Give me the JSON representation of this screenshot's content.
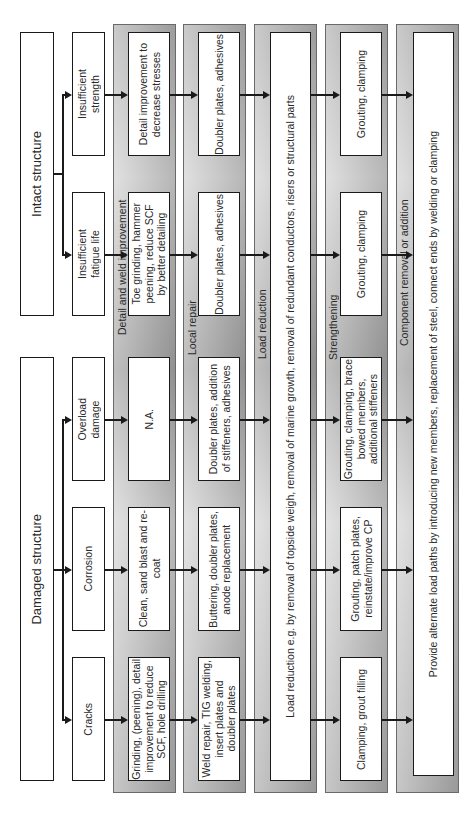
{
  "top": {
    "intact": "Intact structure",
    "damaged": "Damaged structure"
  },
  "causes": [
    {
      "id": "insufficient-strength",
      "label": "Insufficient\nstrength"
    },
    {
      "id": "insufficient-fatigue-life",
      "label": "Insufficient\nfatigue life"
    },
    {
      "id": "overload-damage",
      "label": "Overload\ndamage"
    },
    {
      "id": "corrosion",
      "label": "Corrosion"
    },
    {
      "id": "cracks",
      "label": "Cracks"
    }
  ],
  "bands": [
    {
      "title": "Detail and weld improvement",
      "cells": [
        "Detail improvement to\ndecrease stresses",
        "Toe grinding, hammer\npeening, reduce SCF\nby better detailing",
        "N.A.",
        "Clean, sand blast and re-\ncoat",
        "Grinding, (peening), detail\nimprovement to reduce\nSCF, hole drilling"
      ]
    },
    {
      "title": "Local repair",
      "cells": [
        "Doubler plates, adhesives",
        "Doubler plates, adhesives",
        "Doubler plates, addition\nof stiffeners, adhesives",
        "Buttering, doubler plates,\nanode replacement",
        "Weld repair, TIG welding,\ninsert plates and\ndoubler plates"
      ]
    },
    {
      "title": "Load reduction",
      "full": "Load reduction e.g. by removal of topside weigh, removal of marine growth, removal of redundant conductors, risers or structural parts"
    },
    {
      "title": "Strengthening",
      "cells": [
        "Grouting, clamping",
        "Grouting, clamping",
        "Grouting, clamping, brace\nbowed members,\nadditional stiffeners",
        "Grouting, patch plates,\nreinstate/improve CP",
        "Clamping, grout filling"
      ]
    },
    {
      "title": "Component removal or addition",
      "full": "Provide alternate load paths by introducing new members, replacement of steel, connect ends by welding or clamping"
    }
  ],
  "colors": {
    "line": "#1a1a1a",
    "band_fill": "#bdbdbd",
    "box_fill": "#ffffff"
  }
}
